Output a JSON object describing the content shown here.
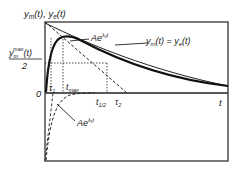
{
  "diagram": {
    "y_axis_label": "y_m(t), y_e(t)",
    "y_axis_label_parts": {
      "y1": "y",
      "s1": "m",
      "mid": "(t), ",
      "y2": "y",
      "s2": "e",
      "end": "(t)"
    },
    "half_max_label": {
      "num_base": "y",
      "num_sub": "m",
      "num_sup": "max",
      "num_tail": "(t)",
      "den": "2"
    },
    "zero_label": "0",
    "t_label": "t",
    "curve_equal_label": {
      "y1": "y",
      "s1": "m",
      "mid": "(t) = ",
      "y2": "y",
      "s2": "e",
      "end": "(t)"
    },
    "exp_upper_label": {
      "base": "Ae",
      "exp": "λ₂t"
    },
    "exp_lower_label": {
      "base": "Ae",
      "exp": "λ₁t"
    },
    "tau1": {
      "base": "τ",
      "sub": "1"
    },
    "tmax": {
      "base": "t",
      "sub": "max"
    },
    "thalf": {
      "base": "t",
      "sub": "1/2"
    },
    "tau2": {
      "base": "τ",
      "sub": "2"
    },
    "colors": {
      "line": "#1a1a1a",
      "frame": "#333333"
    }
  }
}
